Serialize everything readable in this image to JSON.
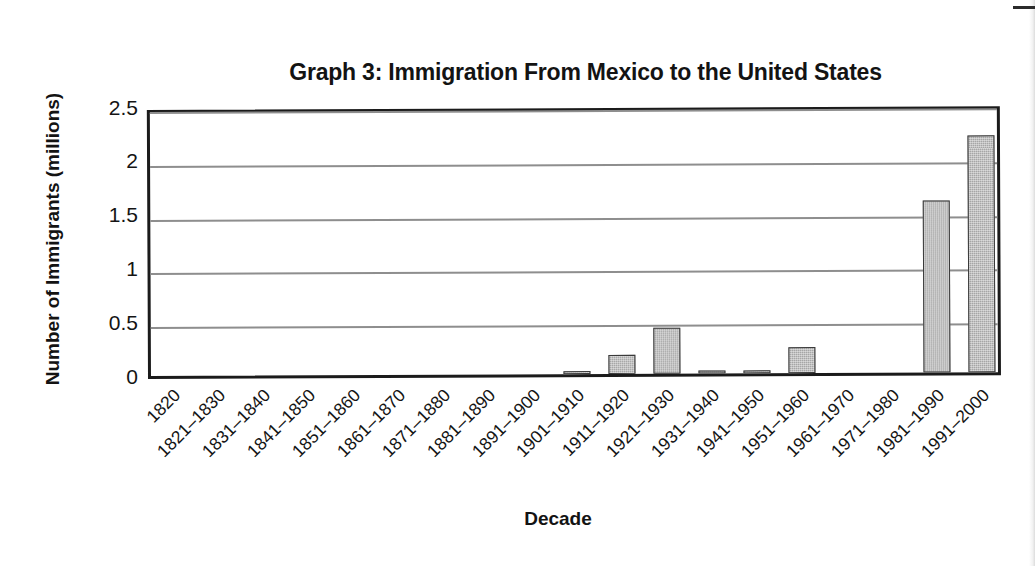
{
  "chart_data": {
    "type": "bar",
    "title": "Graph 3: Immigration From Mexico to the United States",
    "xlabel": "Decade",
    "ylabel": "Number of Immigrants (millions)",
    "categories": [
      "1820",
      "1821–1830",
      "1831–1840",
      "1841–1850",
      "1851–1860",
      "1861–1870",
      "1871–1880",
      "1881–1890",
      "1891–1900",
      "1901–1910",
      "1911–1920",
      "1921–1930",
      "1931–1940",
      "1941–1950",
      "1951–1960",
      "1961–1970",
      "1971–1980",
      "1981–1990",
      "1991–2000"
    ],
    "values": [
      0,
      0,
      0,
      0,
      0,
      0,
      0,
      0,
      0,
      0.03,
      0.18,
      0.43,
      0.005,
      0.03,
      0.24,
      0,
      0,
      1.6,
      2.2
    ],
    "ylim": [
      0,
      2.5
    ],
    "ytick_labels": [
      "0",
      "0.5",
      "1",
      "1.5",
      "2",
      "2.5"
    ],
    "ytick_values": [
      0,
      0.5,
      1,
      1.5,
      2,
      2.5
    ],
    "grid": true,
    "legend": false,
    "bar_color": "#a6a6a6",
    "bar_border_color": "#3a3a3a",
    "axis_color": "#1b1b1b",
    "gridline_color": "#8e8e8e"
  }
}
